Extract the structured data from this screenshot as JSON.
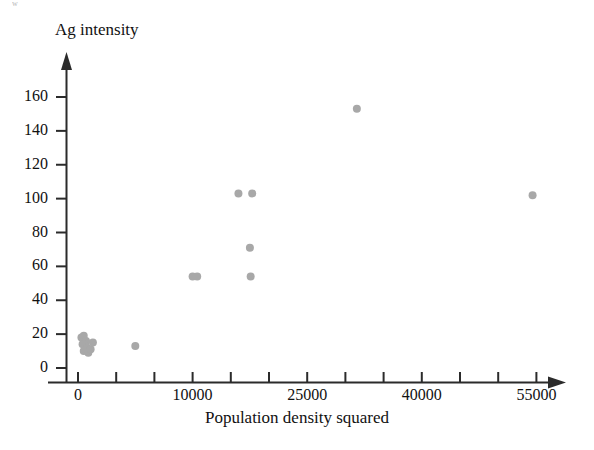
{
  "page": {
    "remnant_text": "w"
  },
  "chart_data": {
    "type": "scatter",
    "title": "",
    "xlabel": "Population density squared",
    "ylabel": "Ag intensity",
    "grid": false,
    "legend": null,
    "marker": {
      "shape": "circle",
      "color": "#a8a8a8",
      "size_px": 8
    },
    "axis_style": "arrow",
    "ylim": [
      0,
      170
    ],
    "yticks": [
      0,
      20,
      40,
      60,
      80,
      100,
      120,
      140,
      160
    ],
    "ytick_labels": [
      "0",
      "20",
      "40",
      "60",
      "80",
      "100",
      "120",
      "140",
      "160"
    ],
    "xtick_labels": [
      "0",
      "10000",
      "25000",
      "40000",
      "55000"
    ],
    "xtick_label_positions": [
      0,
      10000,
      25000,
      40000,
      55000
    ],
    "x_minor_ticks_between_labels": 2,
    "x_axis_note": "Labeled ticks are evenly spaced in pixels with two unlabeled minor ticks between each labeled pair",
    "points": [
      {
        "x": 300,
        "y": 18
      },
      {
        "x": 500,
        "y": 19
      },
      {
        "x": 700,
        "y": 16
      },
      {
        "x": 400,
        "y": 14
      },
      {
        "x": 600,
        "y": 13
      },
      {
        "x": 800,
        "y": 12
      },
      {
        "x": 500,
        "y": 10
      },
      {
        "x": 900,
        "y": 9
      },
      {
        "x": 1100,
        "y": 11
      },
      {
        "x": 1300,
        "y": 15
      },
      {
        "x": 5000,
        "y": 13
      },
      {
        "x": 10000,
        "y": 54
      },
      {
        "x": 10600,
        "y": 54
      },
      {
        "x": 16000,
        "y": 103
      },
      {
        "x": 17800,
        "y": 103
      },
      {
        "x": 17500,
        "y": 71
      },
      {
        "x": 17600,
        "y": 54
      },
      {
        "x": 31500,
        "y": 153
      },
      {
        "x": 54500,
        "y": 102
      }
    ]
  }
}
